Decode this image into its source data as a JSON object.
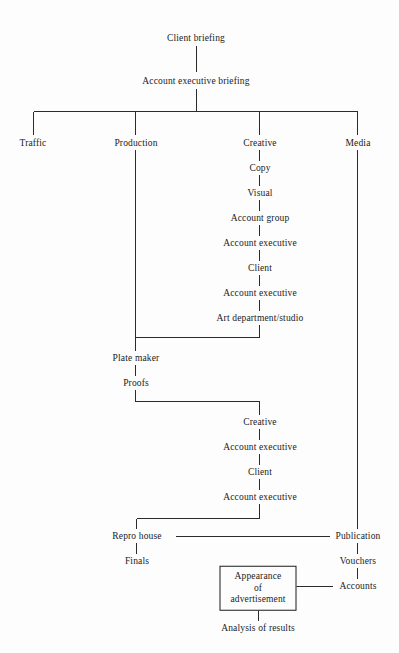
{
  "diagram": {
    "line_color": "#2b2b2b",
    "text_color": "#1b1b1b",
    "background": "#fdfdfd",
    "nodes": [
      {
        "id": "client-briefing",
        "label": "Client briefing",
        "x": 196,
        "y": 38,
        "boxed": false
      },
      {
        "id": "account-exec-briefing",
        "label": "Account executive briefing",
        "x": 196,
        "y": 81,
        "boxed": false
      },
      {
        "id": "traffic",
        "label": "Traffic",
        "x": 33,
        "y": 143,
        "boxed": false
      },
      {
        "id": "production",
        "label": "Production",
        "x": 136,
        "y": 143,
        "boxed": false
      },
      {
        "id": "creative",
        "label": "Creative",
        "x": 260,
        "y": 143,
        "boxed": false
      },
      {
        "id": "media",
        "label": "Media",
        "x": 358,
        "y": 143,
        "boxed": false
      },
      {
        "id": "copy",
        "label": "Copy",
        "x": 260,
        "y": 168,
        "boxed": false
      },
      {
        "id": "visual",
        "label": "Visual",
        "x": 260,
        "y": 193,
        "boxed": false
      },
      {
        "id": "account-group",
        "label": "Account group",
        "x": 260,
        "y": 218,
        "boxed": false
      },
      {
        "id": "account-executive-1",
        "label": "Account executive",
        "x": 260,
        "y": 243,
        "boxed": false
      },
      {
        "id": "client-1",
        "label": "Client",
        "x": 260,
        "y": 268,
        "boxed": false
      },
      {
        "id": "account-executive-2",
        "label": "Account executive",
        "x": 260,
        "y": 293,
        "boxed": false
      },
      {
        "id": "art-department-studio",
        "label": "Art department/studio",
        "x": 260,
        "y": 318,
        "boxed": false
      },
      {
        "id": "plate-maker",
        "label": "Plate maker",
        "x": 136,
        "y": 358,
        "boxed": false
      },
      {
        "id": "proofs",
        "label": "Proofs",
        "x": 136,
        "y": 383,
        "boxed": false
      },
      {
        "id": "creative-2",
        "label": "Creative",
        "x": 260,
        "y": 422,
        "boxed": false
      },
      {
        "id": "account-executive-3",
        "label": "Account executive",
        "x": 260,
        "y": 447,
        "boxed": false
      },
      {
        "id": "client-2",
        "label": "Client",
        "x": 260,
        "y": 472,
        "boxed": false
      },
      {
        "id": "account-executive-4",
        "label": "Account executive",
        "x": 260,
        "y": 497,
        "boxed": false
      },
      {
        "id": "repro-house",
        "label": "Repro house",
        "x": 137,
        "y": 536,
        "boxed": false
      },
      {
        "id": "finals",
        "label": "Finals",
        "x": 137,
        "y": 561,
        "boxed": false
      },
      {
        "id": "publication",
        "label": "Publication",
        "x": 358,
        "y": 536,
        "boxed": false
      },
      {
        "id": "vouchers",
        "label": "Vouchers",
        "x": 358,
        "y": 561,
        "boxed": false
      },
      {
        "id": "accounts",
        "label": "Accounts",
        "x": 358,
        "y": 586,
        "boxed": false
      },
      {
        "id": "appearance-of-advertisement",
        "label": "Appearance of advertisement",
        "x": 258,
        "y": 588,
        "boxed": true
      },
      {
        "id": "analysis-of-results",
        "label": "Analysis of results",
        "x": 258,
        "y": 628,
        "boxed": false
      }
    ],
    "edges": [
      {
        "from": "client-briefing",
        "to": "account-exec-briefing",
        "type": "vertical"
      },
      {
        "from": "account-exec-briefing",
        "to": "branch-bar",
        "type": "vertical"
      },
      {
        "from": "branch-bar",
        "to": "traffic",
        "type": "elbow"
      },
      {
        "from": "branch-bar",
        "to": "production",
        "type": "elbow"
      },
      {
        "from": "branch-bar",
        "to": "creative",
        "type": "elbow"
      },
      {
        "from": "branch-bar",
        "to": "media",
        "type": "elbow"
      },
      {
        "from": "creative",
        "to": "copy",
        "type": "vertical"
      },
      {
        "from": "copy",
        "to": "visual",
        "type": "vertical"
      },
      {
        "from": "visual",
        "to": "account-group",
        "type": "vertical"
      },
      {
        "from": "account-group",
        "to": "account-executive-1",
        "type": "vertical"
      },
      {
        "from": "account-executive-1",
        "to": "client-1",
        "type": "vertical"
      },
      {
        "from": "client-1",
        "to": "account-executive-2",
        "type": "vertical"
      },
      {
        "from": "account-executive-2",
        "to": "art-department-studio",
        "type": "vertical"
      },
      {
        "from": "art-department-studio",
        "to": "plate-maker",
        "type": "elbow"
      },
      {
        "from": "production",
        "to": "plate-maker",
        "type": "vertical"
      },
      {
        "from": "plate-maker",
        "to": "proofs",
        "type": "vertical"
      },
      {
        "from": "proofs",
        "to": "creative-2",
        "type": "elbow"
      },
      {
        "from": "creative-2",
        "to": "account-executive-3",
        "type": "vertical"
      },
      {
        "from": "account-executive-3",
        "to": "client-2",
        "type": "vertical"
      },
      {
        "from": "client-2",
        "to": "account-executive-4",
        "type": "vertical"
      },
      {
        "from": "account-executive-4",
        "to": "repro-house",
        "type": "elbow"
      },
      {
        "from": "repro-house",
        "to": "finals",
        "type": "vertical"
      },
      {
        "from": "repro-house",
        "to": "publication",
        "type": "horizontal"
      },
      {
        "from": "media",
        "to": "publication",
        "type": "vertical"
      },
      {
        "from": "publication",
        "to": "vouchers",
        "type": "vertical"
      },
      {
        "from": "vouchers",
        "to": "accounts",
        "type": "vertical"
      },
      {
        "from": "accounts",
        "to": "appearance-of-advertisement",
        "type": "horizontal"
      },
      {
        "from": "appearance-of-advertisement",
        "to": "analysis-of-results",
        "type": "vertical"
      }
    ]
  }
}
